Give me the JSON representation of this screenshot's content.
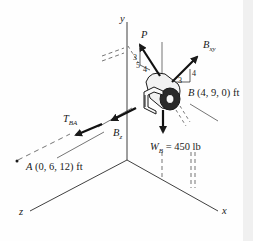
{
  "diagram": {
    "type": "3D free-body / statics diagram",
    "axes": {
      "x": "x",
      "y": "y",
      "z": "z"
    },
    "forces": {
      "P": {
        "symbol": "P",
        "slope": {
          "rise": "3",
          "run": "4",
          "hyp": "5"
        }
      },
      "B_xy": {
        "symbol": "B",
        "subscript": "xy",
        "slope": {
          "rise": "4",
          "run": "3"
        }
      },
      "B_z": {
        "symbol": "B",
        "subscript": "z"
      },
      "T_BA": {
        "symbol": "T",
        "subscript": "BA"
      },
      "W_B": {
        "symbol": "W",
        "subscript": "B",
        "equals": "=",
        "value": "450 lb"
      }
    },
    "points": {
      "B": {
        "label": "B",
        "coords": "(4, 9, 0) ft"
      },
      "A": {
        "label": "A",
        "coords": "(0, 6, 12) ft"
      }
    },
    "colors": {
      "ink": "#1a1a1a",
      "background": "#fefefe",
      "edge": "#f0f0f0"
    }
  }
}
